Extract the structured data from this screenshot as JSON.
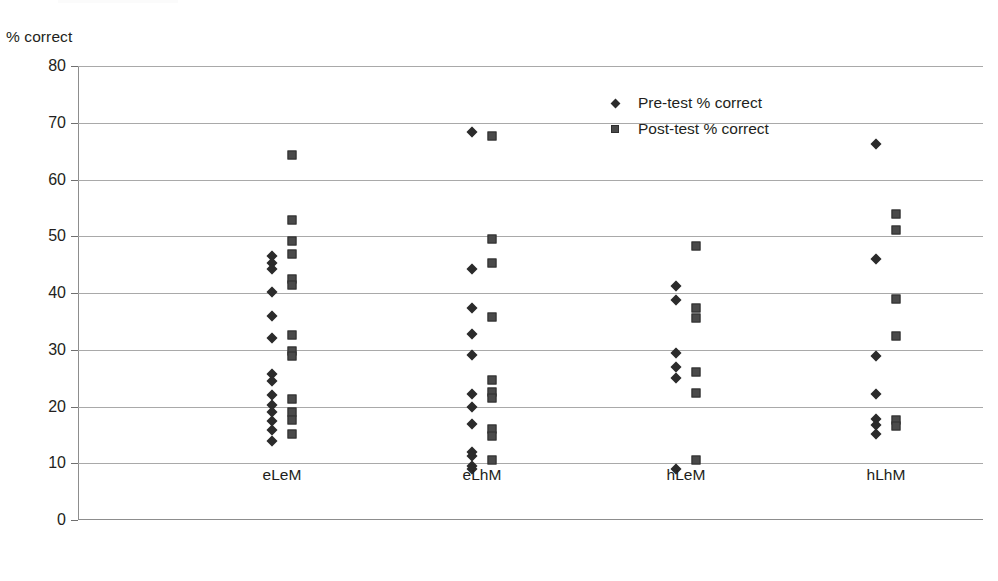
{
  "axis": {
    "ylabel": "% correct",
    "xlabel": "",
    "yticks": [
      0,
      10,
      20,
      30,
      40,
      50,
      60,
      70,
      80
    ],
    "ylim": [
      0,
      80
    ],
    "categories": [
      "eLeM",
      "eLhM",
      "hLeM",
      "hLhM"
    ]
  },
  "legend": {
    "position": "inside-top-right",
    "entries": [
      {
        "label": "Pre-test % correct",
        "marker": "diamond-marker",
        "color": "#2b2b2b"
      },
      {
        "label": "Post-test % correct",
        "marker": "square-marker",
        "color": "#4a4a4a"
      }
    ]
  },
  "chart_data": {
    "type": "scatter",
    "title": "",
    "xlabel": "",
    "ylabel": "% correct",
    "ylim": [
      0,
      80
    ],
    "yticks": [
      0,
      10,
      20,
      30,
      40,
      50,
      60,
      70,
      80
    ],
    "grid": "horizontal",
    "legend_position": "inside-top-right",
    "categories": [
      "eLeM",
      "eLhM",
      "hLeM",
      "hLhM"
    ],
    "series": [
      {
        "name": "Pre-test % correct",
        "marker": "diamond",
        "color": "#2b2b2b",
        "groups": [
          {
            "category": "eLeM",
            "values": [
              46.6,
              45.3,
              44.3,
              40.2,
              36.0,
              32.0,
              25.8,
              24.5,
              22.1,
              20.3,
              19.0,
              17.4,
              15.9,
              14.0
            ]
          },
          {
            "category": "eLhM",
            "values": [
              68.3,
              44.3,
              37.3,
              32.7,
              29.0,
              22.2,
              20.0,
              17.0,
              12.0,
              11.3,
              9.5,
              8.9
            ]
          },
          {
            "category": "hLeM",
            "values": [
              41.2,
              38.8,
              29.4,
              27.0,
              25.1,
              9.0
            ]
          },
          {
            "category": "hLhM",
            "values": [
              66.3,
              46.0,
              28.9,
              22.2,
              17.8,
              16.7,
              15.1
            ]
          }
        ]
      },
      {
        "name": "Post-test % correct",
        "marker": "square",
        "color": "#4a4a4a",
        "groups": [
          {
            "category": "eLeM",
            "values": [
              64.4,
              52.8,
              49.2,
              46.9,
              42.4,
              41.4,
              32.6,
              29.7,
              28.9,
              21.3,
              19.1,
              17.7,
              15.2
            ]
          },
          {
            "category": "eLhM",
            "values": [
              67.6,
              49.5,
              45.2,
              35.8,
              24.7,
              22.6,
              21.5,
              16.0,
              14.8,
              10.6
            ]
          },
          {
            "category": "hLeM",
            "values": [
              48.2,
              37.3,
              35.6,
              26.1,
              22.4,
              10.5
            ]
          },
          {
            "category": "hLhM",
            "values": [
              53.9,
              51.1,
              38.9,
              32.4,
              17.6,
              16.5
            ]
          }
        ]
      }
    ]
  },
  "layout": {
    "plot_left": 78,
    "plot_top": 66,
    "plot_width": 905,
    "plot_height": 454,
    "category_centers_px": [
      282,
      482,
      686,
      886
    ],
    "pre_offset_px": -10,
    "post_offset_px": 10
  }
}
